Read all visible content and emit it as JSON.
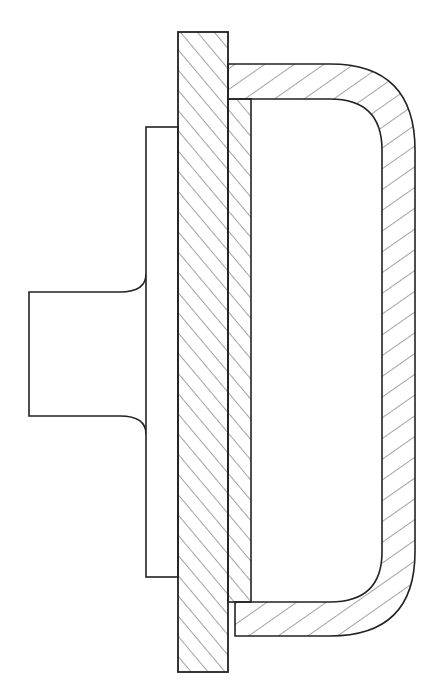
{
  "figure": {
    "stroke_color": "#222222",
    "background": "#ffffff"
  },
  "parts": [
    {
      "name": "hub",
      "hatched": false
    },
    {
      "name": "spacer-plate",
      "hatched": false
    },
    {
      "name": "main-flange-plate",
      "hatched": true,
      "hatch_direction": "right-leaning"
    },
    {
      "name": "inner-plate",
      "hatched": true,
      "hatch_direction": "right-leaning"
    },
    {
      "name": "u-shaped-cover",
      "hatched": true,
      "hatch_direction": "left-leaning"
    }
  ]
}
